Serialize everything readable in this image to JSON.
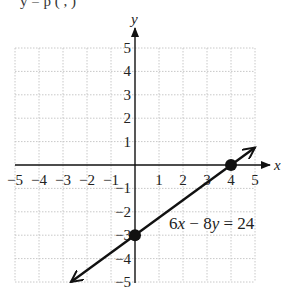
{
  "header": {
    "cropped_text": "y  =  p  ( ,  )"
  },
  "chart_data": {
    "type": "line",
    "title": "",
    "xlabel": "x",
    "ylabel": "y",
    "xlim": [
      -5,
      5
    ],
    "ylim": [
      -5,
      5
    ],
    "grid": true,
    "x_ticks": [
      -5,
      -4,
      -3,
      -2,
      -1,
      1,
      2,
      3,
      4,
      5
    ],
    "y_ticks": [
      -5,
      -4,
      -3,
      -2,
      -1,
      1,
      2,
      3,
      4,
      5
    ],
    "x_tick_labels": [
      "−5",
      "−4",
      "−3",
      "−2",
      "−1",
      "1",
      "2",
      "3",
      "4",
      "5"
    ],
    "y_tick_labels": [
      "−5",
      "−4",
      "−3",
      "−2",
      "−1",
      "1",
      "2",
      "3",
      "4",
      "5"
    ],
    "series": [
      {
        "name": "6x − 8y = 24",
        "equation": "6x − 8y = 24",
        "slope": 0.75,
        "intercept": -3,
        "x": [
          -2.67,
          5
        ],
        "y": [
          -5,
          0.75
        ],
        "arrows": "both"
      }
    ],
    "points": [
      {
        "label": "x-intercept",
        "x": 4,
        "y": 0
      },
      {
        "label": "y-intercept",
        "x": 0,
        "y": -3
      }
    ],
    "annotations": [
      {
        "text": "6x − 8y = 24",
        "x": 1.3,
        "y": -2.5
      }
    ]
  },
  "labels": {
    "x_axis": "x",
    "y_axis": "y",
    "equation_6": "6",
    "equation_x": "x",
    "equation_minus": " − 8",
    "equation_y": "y",
    "equation_rest": " = 24"
  }
}
